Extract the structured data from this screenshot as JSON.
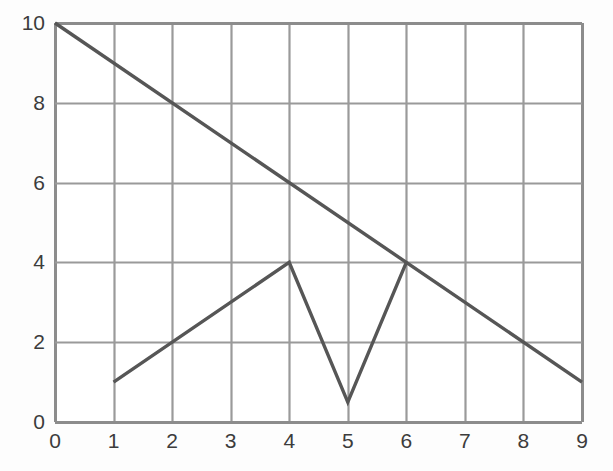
{
  "chart_data": {
    "type": "line",
    "title": "",
    "subtitle": "",
    "xlabel": "",
    "ylabel": "",
    "xlim": [
      0,
      9
    ],
    "ylim": [
      0,
      10
    ],
    "x_ticks": [
      0,
      1,
      2,
      3,
      4,
      5,
      6,
      7,
      8,
      9
    ],
    "x_tick_labels": [
      "0",
      "1",
      "2",
      "3",
      "4",
      "5",
      "6",
      "7",
      "8",
      "9"
    ],
    "y_ticks": [
      0,
      2,
      4,
      6,
      8,
      10
    ],
    "y_tick_labels": [
      "0",
      "2",
      "4",
      "6",
      "8",
      "10"
    ],
    "grid": true,
    "grid_x_lines": [
      0,
      1,
      2,
      3,
      4,
      5,
      6,
      7,
      8,
      9
    ],
    "grid_y_lines": [
      0,
      2,
      4,
      6,
      8,
      10
    ],
    "legend": "none",
    "legend_position": "none",
    "annotations": [],
    "series": [
      {
        "name": "descending-line",
        "points": [
          [
            0,
            10
          ],
          [
            9,
            1
          ]
        ],
        "color": "#565656",
        "width": 3.4
      },
      {
        "name": "zigzag-line",
        "points": [
          [
            1,
            1
          ],
          [
            4,
            4
          ],
          [
            5,
            0.5
          ],
          [
            6,
            4
          ]
        ],
        "color": "#565656",
        "width": 3.4
      }
    ]
  },
  "style": {
    "background_color": "#fdfdfd",
    "plot_background_color": "#ffffff",
    "grid_color": "#9a9a9a",
    "border_color": "#8c8c8c",
    "tick_label_color": "#3c3c3c",
    "series_color": "#565656"
  },
  "geometry": {
    "plot_left": 55,
    "plot_right": 582,
    "plot_top": 23,
    "plot_bottom": 422
  }
}
